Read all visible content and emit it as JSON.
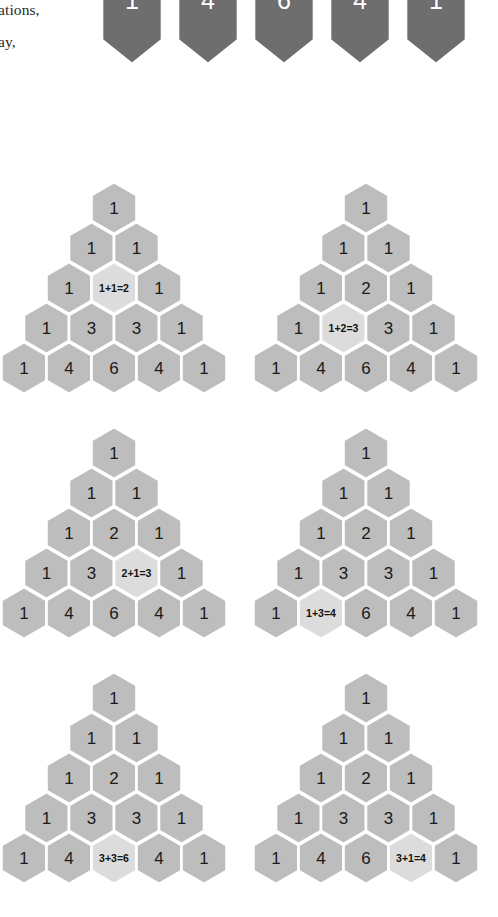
{
  "page": {
    "background_color": "#ffffff",
    "width": 498,
    "height": 917
  },
  "body_text": {
    "line1": "ations,",
    "line2": "ay,"
  },
  "colors": {
    "hex_fill": "#bdbdbd",
    "hex_highlight_fill": "#dcdcdc",
    "hex_dark_fill": "#6e6e6e",
    "hex_stroke": "#ffffff",
    "number_color": "#1a1a1a",
    "dark_number_color": "#ffffff"
  },
  "dark_strip": {
    "label": "pascal-row-4-dark-hexagons",
    "values": [
      "1",
      "4",
      "6",
      "4",
      "1"
    ]
  },
  "chart_data": {
    "type": "diagram",
    "rows": [
      [
        "1"
      ],
      [
        "1",
        "1"
      ],
      [
        "1",
        "2",
        "1"
      ],
      [
        "1",
        "3",
        "3",
        "1"
      ],
      [
        "1",
        "4",
        "6",
        "4",
        "1"
      ]
    ],
    "figures": [
      {
        "id": "fig-1",
        "highlight_row": 3,
        "highlight_col": 2,
        "equation": "1+1=2",
        "result": "2",
        "addends": [
          "1",
          "1"
        ]
      },
      {
        "id": "fig-2",
        "highlight_row": 4,
        "highlight_col": 2,
        "equation": "1+2=3",
        "result": "3",
        "addends": [
          "1",
          "2"
        ]
      },
      {
        "id": "fig-3",
        "highlight_row": 4,
        "highlight_col": 3,
        "equation": "2+1=3",
        "result": "3",
        "addends": [
          "2",
          "1"
        ]
      },
      {
        "id": "fig-4",
        "highlight_row": 5,
        "highlight_col": 2,
        "equation": "1+3=4",
        "result": "4",
        "addends": [
          "1",
          "3"
        ]
      },
      {
        "id": "fig-5",
        "highlight_row": 5,
        "highlight_col": 3,
        "equation": "3+3=6",
        "result": "6",
        "addends": [
          "3",
          "3"
        ]
      },
      {
        "id": "fig-6",
        "highlight_row": 5,
        "highlight_col": 4,
        "equation": "3+1=4",
        "result": "4",
        "addends": [
          "3",
          "1"
        ]
      }
    ]
  },
  "layout": {
    "figure_positions": [
      {
        "left": 0,
        "top": 0
      },
      {
        "left": 252,
        "top": 0
      },
      {
        "left": 0,
        "top": 245
      },
      {
        "left": 252,
        "top": 245
      },
      {
        "left": 0,
        "top": 490
      },
      {
        "left": 252,
        "top": 490
      }
    ],
    "hex_width": 45,
    "hex_height": 52,
    "row_step": 40,
    "triangle_origin_x": 114,
    "triangle_origin_y": 30
  }
}
